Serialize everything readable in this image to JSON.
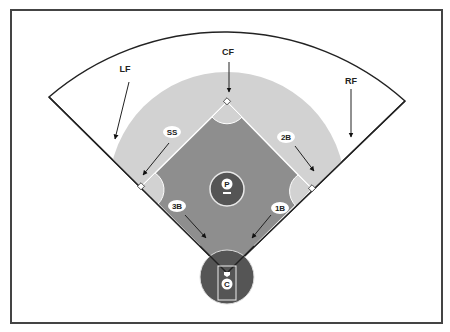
{
  "diagram": {
    "colors": {
      "frame": "#444444",
      "fence": "#222222",
      "outfield_grass": "#d2d2d2",
      "infield": "#8e8e8e",
      "mound_and_home": "#555555",
      "base_lines": "#ffffff"
    },
    "positions": {
      "lf": "LF",
      "cf": "CF",
      "rf": "RF",
      "ss": "SS",
      "second_base": "2B",
      "third_base": "3B",
      "first_base": "1B",
      "pitcher": "P",
      "catcher": "C"
    }
  }
}
